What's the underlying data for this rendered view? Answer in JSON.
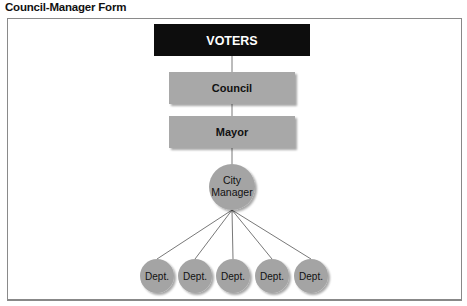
{
  "title": "Council-Manager Form",
  "nodes": {
    "voters": "VOTERS",
    "council": "Council",
    "mayor": "Mayor",
    "city_manager_line1": "City",
    "city_manager_line2": "Manager",
    "departments": [
      "Dept.",
      "Dept.",
      "Dept.",
      "Dept.",
      "Dept."
    ]
  },
  "colors": {
    "voters_fill": "#0d0d0d",
    "box_fill": "#a8a8a8",
    "circle_fill": "#a4a4a4",
    "line": "#555555"
  }
}
